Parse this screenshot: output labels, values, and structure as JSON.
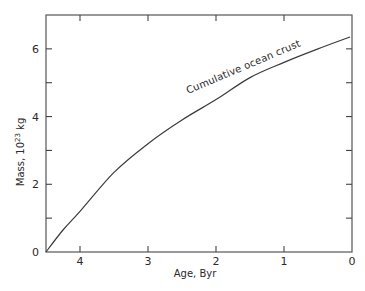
{
  "chart_data": {
    "type": "line",
    "title": "",
    "xlabel": "Age, Byr",
    "ylabel": "Mass, 10^23 kg",
    "ylabel_parts": {
      "prefix": "Mass, 10",
      "sup": "23",
      "suffix": " kg"
    },
    "xlim": [
      4.5,
      0
    ],
    "ylim": [
      0,
      7
    ],
    "x_reversed": true,
    "x_ticks": [
      4,
      3,
      2,
      1,
      0
    ],
    "x_tick_labels": [
      "4",
      "3",
      "2",
      "1",
      "0"
    ],
    "y_ticks": [
      0,
      1,
      2,
      3,
      4,
      5,
      6
    ],
    "y_tick_labels": [
      "0",
      "",
      "2",
      "",
      "4",
      "",
      "6"
    ],
    "grid": false,
    "legend": null,
    "series": [
      {
        "name": "Cumulative ocean crust",
        "x": [
          4.5,
          4.25,
          4.0,
          3.5,
          3.0,
          2.5,
          2.0,
          1.5,
          1.0,
          0.5,
          0.03
        ],
        "y": [
          0.0,
          0.65,
          1.2,
          2.35,
          3.2,
          3.9,
          4.5,
          5.15,
          5.6,
          6.0,
          6.35
        ]
      }
    ],
    "annotations": [
      {
        "text": "Cumulative ocean crust",
        "x": 1.75,
        "y": 5.0,
        "rotation_deg": -23
      }
    ]
  },
  "labels": {
    "x_axis": "Age, Byr",
    "y_axis_prefix": "Mass, 10",
    "y_axis_sup": "23",
    "y_axis_suffix": " kg",
    "curve_annotation": "Cumulative ocean crust"
  },
  "colors": {
    "line": "#3a3a3a",
    "frame": "#555555",
    "text": "#2a2a2a",
    "background": "#ffffff"
  }
}
